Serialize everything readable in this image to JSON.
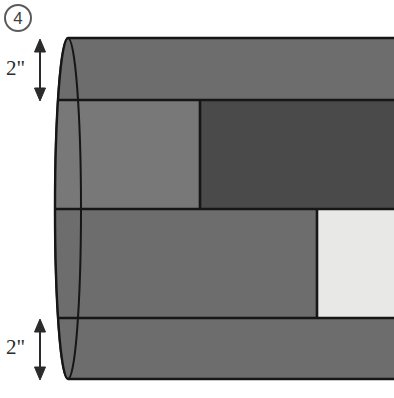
{
  "problem": {
    "number": "4"
  },
  "figure": {
    "shape": "cylinder",
    "orientation": "horizontal",
    "cut_off_at_right_edge": true,
    "colors": {
      "band_medium": "#6d6d6d",
      "band_light": "#787878",
      "band_dark": "#4a4a4a",
      "band_white": "#e8e8e6",
      "end_cap": "#cfcfcf",
      "outline": "#161616",
      "badge_ring": "#5b5b5b",
      "label_text": "#2b2b2b",
      "background": "#ffffff"
    },
    "bands": [
      {
        "name": "top-band",
        "fill": "#6d6d6d",
        "y_top": 38,
        "y_bottom": 100,
        "x_left": 68,
        "x_right": 394
      },
      {
        "name": "middle-left-light-band",
        "fill": "#787878",
        "y_top": 100,
        "y_bottom": 209,
        "x_left": 68,
        "x_right": 200
      },
      {
        "name": "middle-right-dark-band",
        "fill": "#4a4a4a",
        "y_top": 100,
        "y_bottom": 209,
        "x_left": 200,
        "x_right": 394
      },
      {
        "name": "lower-left-medium-band",
        "fill": "#6d6d6d",
        "y_top": 209,
        "y_bottom": 318,
        "x_left": 68,
        "x_right": 317
      },
      {
        "name": "lower-right-white-band",
        "fill": "#e8e8e6",
        "y_top": 209,
        "y_bottom": 318,
        "x_left": 317,
        "x_right": 394
      },
      {
        "name": "bottom-band",
        "fill": "#6d6d6d",
        "y_top": 318,
        "y_bottom": 379,
        "x_left": 68,
        "x_right": 394
      }
    ]
  },
  "dimensions": [
    {
      "id": "top",
      "label": "2\"",
      "arrow": {
        "x": 40,
        "y_top": 41,
        "y_bottom": 99
      },
      "measures": "top-band height"
    },
    {
      "id": "bottom",
      "label": "2\"",
      "arrow": {
        "x": 40,
        "y_top": 320,
        "y_bottom": 378
      },
      "measures": "bottom-band height"
    }
  ]
}
